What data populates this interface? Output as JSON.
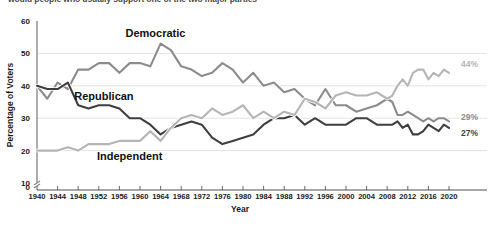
{
  "caption": "would people who usually support one of the two major parties",
  "chart_data": {
    "type": "line",
    "title": "",
    "xlabel": "Year",
    "ylabel": "Percentage of Voters",
    "xlim": [
      1940,
      2020
    ],
    "ylim": [
      10,
      60
    ],
    "y_axis_break": true,
    "yticks": [
      "0",
      "10",
      "20",
      "30",
      "40",
      "50",
      "60"
    ],
    "xticks": [
      "1940",
      "1944",
      "1948",
      "1952",
      "1956",
      "1960",
      "1964",
      "1968",
      "1972",
      "1976",
      "1980",
      "1984",
      "1988",
      "1992",
      "1996",
      "2000",
      "2004",
      "2008",
      "2012",
      "2016",
      "2020"
    ],
    "grid": true,
    "legend_position": "inline-labels",
    "series": [
      {
        "name": "Democratic",
        "color": "#8c8c8c",
        "label_x": 1963,
        "label_y": 55,
        "end_label": "29%",
        "x": [
          1940,
          1942,
          1944,
          1946,
          1948,
          1950,
          1952,
          1954,
          1956,
          1958,
          1960,
          1962,
          1964,
          1966,
          1968,
          1970,
          1972,
          1974,
          1976,
          1978,
          1980,
          1982,
          1984,
          1986,
          1988,
          1990,
          1992,
          1994,
          1996,
          1998,
          2000,
          2002,
          2004,
          2006,
          2008,
          2009,
          2010,
          2011,
          2012,
          2013,
          2014,
          2015,
          2016,
          2017,
          2018,
          2019,
          2020
        ],
        "values": [
          40,
          36,
          41,
          39,
          45,
          45,
          47,
          47,
          44,
          47,
          47,
          46,
          53,
          51,
          46,
          45,
          43,
          44,
          47,
          45,
          41,
          44,
          40,
          41,
          38,
          39,
          36,
          34,
          39,
          34,
          34,
          32,
          33,
          34,
          36,
          35,
          31,
          31,
          32,
          31,
          30,
          29,
          30,
          29,
          30,
          30,
          29
        ]
      },
      {
        "name": "Republican",
        "color": "#3f3f3f",
        "label_x": 1953,
        "label_y": 35.5,
        "end_label": "27%",
        "x": [
          1940,
          1942,
          1944,
          1946,
          1948,
          1950,
          1952,
          1954,
          1956,
          1958,
          1960,
          1962,
          1964,
          1966,
          1968,
          1970,
          1972,
          1974,
          1976,
          1978,
          1980,
          1982,
          1984,
          1986,
          1988,
          1990,
          1992,
          1994,
          1996,
          1998,
          2000,
          2002,
          2004,
          2006,
          2008,
          2009,
          2010,
          2011,
          2012,
          2013,
          2014,
          2015,
          2016,
          2017,
          2018,
          2019,
          2020
        ],
        "values": [
          40,
          39,
          39,
          41,
          34,
          33,
          34,
          34,
          33,
          30,
          30,
          28,
          25,
          27,
          28,
          29,
          28,
          24,
          22,
          23,
          24,
          25,
          28,
          30,
          30,
          31,
          28,
          30,
          28,
          28,
          28,
          30,
          30,
          28,
          28,
          28,
          29,
          27,
          28,
          25,
          25,
          26,
          28,
          27,
          26,
          28,
          27
        ]
      },
      {
        "name": "Independent",
        "color": "#b5b5b5",
        "label_x": 1958,
        "label_y": 17,
        "end_label": "44%",
        "x": [
          1940,
          1942,
          1944,
          1946,
          1948,
          1950,
          1952,
          1954,
          1956,
          1958,
          1960,
          1962,
          1964,
          1966,
          1968,
          1970,
          1972,
          1974,
          1976,
          1978,
          1980,
          1982,
          1984,
          1986,
          1988,
          1990,
          1992,
          1994,
          1996,
          1998,
          2000,
          2002,
          2004,
          2006,
          2008,
          2009,
          2010,
          2011,
          2012,
          2013,
          2014,
          2015,
          2016,
          2017,
          2018,
          2019,
          2020
        ],
        "values": [
          20,
          20,
          20,
          21,
          20,
          22,
          22,
          22,
          23,
          23,
          23,
          26,
          23,
          27,
          30,
          31,
          30,
          33,
          31,
          32,
          34,
          30,
          32,
          30,
          32,
          31,
          36,
          35,
          33,
          37,
          38,
          37,
          37,
          38,
          36,
          37,
          40,
          42,
          40,
          44,
          45,
          45,
          42,
          44,
          43,
          45,
          44
        ]
      }
    ]
  }
}
